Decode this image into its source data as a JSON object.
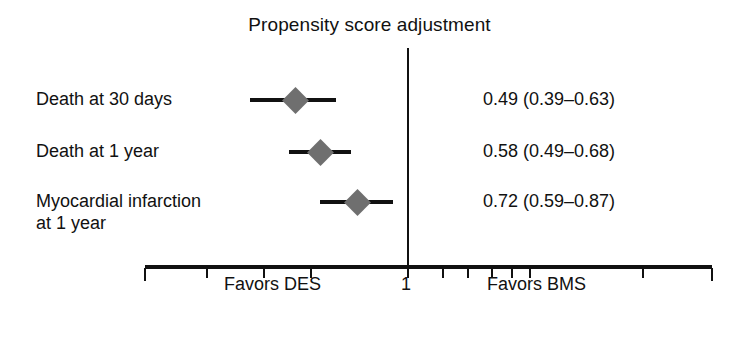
{
  "chart_data": {
    "type": "forest",
    "title": "Propensity score adjustment",
    "xlabel": "",
    "ylabel": "",
    "scale": "log",
    "reference_value": 1,
    "reference_label": "1",
    "grid": false,
    "legend": "none",
    "axis_caption_left": "Favors DES",
    "axis_caption_right": "Favors BMS",
    "axis_tick_positions_px": [
      145,
      207,
      264,
      311,
      408,
      443,
      468,
      492,
      512,
      530,
      643,
      712
    ],
    "axis_range_px": [
      145,
      712
    ],
    "effect_measure": "Hazard ratio",
    "categories": [
      "Death at 30 days",
      "Death at 1 year",
      "Myocardial infarction\nat 1 year"
    ],
    "rows": [
      {
        "label": "Death at 30 days",
        "estimate": 0.49,
        "ci_low": 0.39,
        "ci_high": 0.63,
        "value_text": "0.49 (0.39–0.63)",
        "marker_x_px": 295,
        "ci_left_px": 250,
        "ci_right_px": 336,
        "row_y_px": 100
      },
      {
        "label": "Death at 1 year",
        "estimate": 0.58,
        "ci_low": 0.49,
        "ci_high": 0.68,
        "value_text": "0.58 (0.49–0.68)",
        "marker_x_px": 320,
        "ci_left_px": 289,
        "ci_right_px": 351,
        "row_y_px": 152
      },
      {
        "label": "Myocardial infarction\nat 1 year",
        "estimate": 0.72,
        "ci_low": 0.59,
        "ci_high": 0.87,
        "value_text": "0.72 (0.59–0.87)",
        "marker_x_px": 357,
        "ci_left_px": 320,
        "ci_right_px": 393,
        "row_y_px": 202
      }
    ],
    "values": [
      0.49,
      0.58,
      0.72
    ],
    "ci_low": [
      0.39,
      0.49,
      0.59
    ],
    "ci_high": [
      0.63,
      0.68,
      0.87
    ],
    "value_labels": [
      "0.49 (0.39–0.63)",
      "0.58 (0.49–0.68)",
      "0.72 (0.59–0.87)"
    ],
    "colors": {
      "marker": "#6f6f6f",
      "line": "#111111",
      "text": "#111111",
      "background": "#ffffff"
    }
  }
}
